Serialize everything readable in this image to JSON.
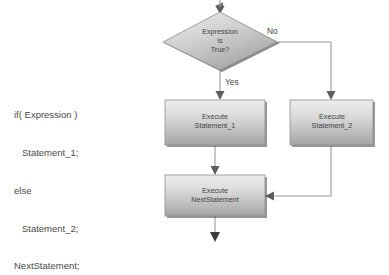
{
  "canvas": {
    "width": 389,
    "height": 256,
    "background": "#ffffff"
  },
  "code": {
    "lines": [
      "if( Expression )",
      "   Statement_1;",
      "else",
      "   Statement_2;",
      "NextStatement;"
    ],
    "text": "if( Expression )\n   Statement_1;\nelse\n   Statement_2;\nNextStatement;"
  },
  "flowchart": {
    "type": "flowchart",
    "nodes": [
      {
        "id": "decision",
        "shape": "diamond",
        "label": "Expression\nis\nTrue?",
        "lines": [
          "Expression",
          "is",
          "True?"
        ]
      },
      {
        "id": "statement1",
        "shape": "process",
        "label": "Execute\nStatement_1",
        "lines": [
          "Execute",
          "Statement_1"
        ]
      },
      {
        "id": "statement2",
        "shape": "process",
        "label": "Execute\nStatement_2",
        "lines": [
          "Execute",
          "Statement_2"
        ]
      },
      {
        "id": "nextstatement",
        "shape": "process",
        "label": "Execute\nNextStatement",
        "lines": [
          "Execute",
          "NextStatement"
        ]
      }
    ],
    "edge_labels": {
      "yes": "Yes",
      "no": "No"
    }
  },
  "colors": {
    "node_fill_light": "#e8e8e8",
    "node_fill_dark": "#a8a8a8",
    "node_border": "#6e6e6e",
    "node_shadow": "#2f2f2f",
    "connector": "#8a8a8a",
    "text": "#434343",
    "code_text": "#4a4a4a",
    "background": "#ffffff"
  }
}
